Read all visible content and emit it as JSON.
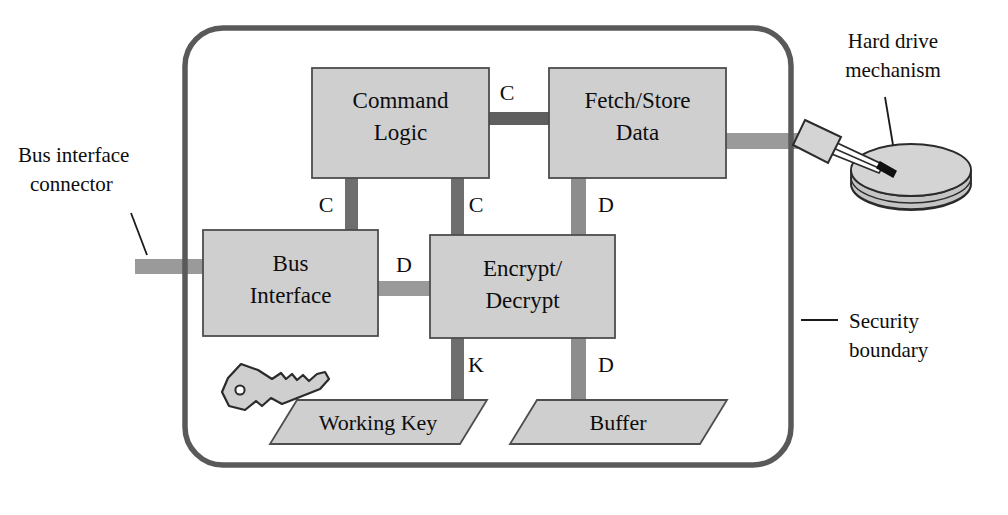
{
  "diagram": {
    "colors": {
      "boundary_stroke": "#595959",
      "block_fill": "#cfcfcf",
      "block_stroke": "#4d4d4d",
      "bus_dark": "#6e6e6e",
      "bus_light": "#9a9a9a",
      "background": "#ffffff",
      "text": "#0d0d0d",
      "disk_fill": "#d4d4d4"
    },
    "blocks": [
      {
        "id": "command-logic",
        "lines": [
          "Command",
          "Logic"
        ],
        "x": 312,
        "y": 68,
        "w": 177,
        "h": 110
      },
      {
        "id": "fetch-store-data",
        "lines": [
          "Fetch/Store",
          "Data"
        ],
        "x": 549,
        "y": 68,
        "w": 177,
        "h": 110
      },
      {
        "id": "bus-interface",
        "lines": [
          "Bus",
          "Interface"
        ],
        "x": 203,
        "y": 230,
        "w": 175,
        "h": 106
      },
      {
        "id": "encrypt-decrypt",
        "lines": [
          "Encrypt/",
          "Decrypt"
        ],
        "x": 430,
        "y": 235,
        "w": 185,
        "h": 103
      }
    ],
    "parallelograms": [
      {
        "id": "working-key",
        "label": "Working Key",
        "cx": 368,
        "cy": 418
      },
      {
        "id": "buffer",
        "label": "Buffer",
        "cx": 618,
        "cy": 418
      }
    ],
    "edge_labels": [
      {
        "id": "cmd-to-fetch",
        "text": "C",
        "x": 507,
        "y": 100
      },
      {
        "id": "cmd-to-bus",
        "text": "C",
        "x": 326,
        "y": 205
      },
      {
        "id": "cmd-to-encrypt",
        "text": "C",
        "x": 473,
        "y": 205
      },
      {
        "id": "fetch-to-encrypt",
        "text": "D",
        "x": 604,
        "y": 205
      },
      {
        "id": "bus-to-encrypt",
        "text": "D",
        "x": 404,
        "y": 265
      },
      {
        "id": "encrypt-to-key",
        "text": "K",
        "x": 473,
        "y": 368
      },
      {
        "id": "encrypt-to-buf",
        "text": "D",
        "x": 604,
        "y": 368
      }
    ],
    "callouts": [
      {
        "id": "bus-interface-connector",
        "lines": [
          "Bus interface",
          "connector"
        ],
        "x": 16,
        "y": 160,
        "align": "start"
      },
      {
        "id": "hard-drive-mechanism",
        "lines": [
          "Hard drive",
          "mechanism"
        ],
        "x": 893,
        "y": 46,
        "align": "middle"
      },
      {
        "id": "security-boundary",
        "lines": [
          "Security",
          "boundary"
        ],
        "x": 832,
        "y": 326,
        "align": "start"
      }
    ],
    "icons": {
      "key": "key-icon",
      "disk": "hard-disk-platter-icon",
      "actuator": "actuator-arm-icon"
    }
  }
}
